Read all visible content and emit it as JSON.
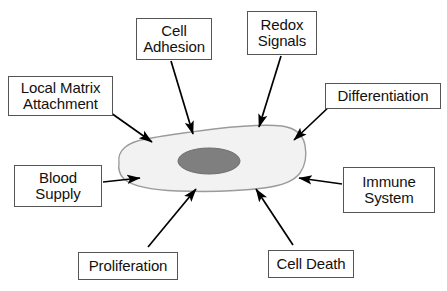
{
  "diagram": {
    "background_color": "#ffffff",
    "cell": {
      "name": "cell-body",
      "fill_color": "#f2f2f2",
      "stroke_color": "#999999",
      "nucleus": {
        "name": "nucleus",
        "fill_color": "#808080",
        "stroke_color": "#6e6e6e"
      }
    },
    "arrow_color": "#000000",
    "box_border_color": "#555555",
    "box_fill_color": "#ffffff",
    "text_color": "#111111",
    "labels": [
      {
        "id": "local-matrix-attachment",
        "lines": [
          "Local Matrix",
          "Attachment"
        ],
        "line1": "Local Matrix",
        "line2": "Attachment",
        "position": "upper-left",
        "x": 8,
        "y": 76,
        "w": 105,
        "h": 40
      },
      {
        "id": "cell-adhesion",
        "lines": [
          "Cell",
          "Adhesion"
        ],
        "line1": "Cell",
        "line2": "Adhesion",
        "position": "top-left-center",
        "x": 136,
        "y": 18,
        "w": 76,
        "h": 42
      },
      {
        "id": "redox-signals",
        "lines": [
          "Redox",
          "Signals"
        ],
        "line1": "Redox",
        "line2": "Signals",
        "position": "top-right-center",
        "x": 247,
        "y": 11,
        "w": 70,
        "h": 44
      },
      {
        "id": "differentiation",
        "lines": [
          "Differentiation"
        ],
        "line1": "Differentiation",
        "line2": "",
        "position": "upper-right",
        "x": 325,
        "y": 83,
        "w": 116,
        "h": 26
      },
      {
        "id": "blood-supply",
        "lines": [
          "Blood",
          "Supply"
        ],
        "line1": "Blood",
        "line2": "Supply",
        "position": "left",
        "x": 14,
        "y": 165,
        "w": 88,
        "h": 42
      },
      {
        "id": "immune-system",
        "lines": [
          "Immune",
          "System"
        ],
        "line1": "Immune",
        "line2": "System",
        "position": "right",
        "x": 343,
        "y": 167,
        "w": 92,
        "h": 46
      },
      {
        "id": "proliferation",
        "lines": [
          "Proliferation"
        ],
        "line1": "Proliferation",
        "line2": "",
        "position": "bottom-left",
        "x": 78,
        "y": 252,
        "w": 100,
        "h": 28
      },
      {
        "id": "cell-death",
        "lines": [
          "Cell Death"
        ],
        "line1": "Cell Death",
        "line2": "",
        "position": "bottom-right",
        "x": 268,
        "y": 250,
        "w": 86,
        "h": 28
      }
    ],
    "arrows": [
      {
        "id": "arrow-local-matrix-attachment",
        "from": "local-matrix-attachment",
        "to": "cell-body",
        "x1": 104,
        "y1": 108,
        "x2": 152,
        "y2": 142
      },
      {
        "id": "arrow-cell-adhesion",
        "from": "cell-adhesion",
        "to": "cell-body",
        "x1": 171,
        "y1": 61,
        "x2": 193,
        "y2": 134
      },
      {
        "id": "arrow-redox-signals",
        "from": "redox-signals",
        "to": "cell-body",
        "x1": 281,
        "y1": 56,
        "x2": 259,
        "y2": 127
      },
      {
        "id": "arrow-differentiation",
        "from": "differentiation",
        "to": "cell-body",
        "x1": 332,
        "y1": 104,
        "x2": 294,
        "y2": 140
      },
      {
        "id": "arrow-blood-supply",
        "from": "blood-supply",
        "to": "cell-body",
        "x1": 103,
        "y1": 182,
        "x2": 140,
        "y2": 178
      },
      {
        "id": "arrow-immune-system",
        "from": "immune-system",
        "to": "cell-body",
        "x1": 342,
        "y1": 184,
        "x2": 299,
        "y2": 178
      },
      {
        "id": "arrow-proliferation",
        "from": "proliferation",
        "to": "cell-body",
        "x1": 148,
        "y1": 247,
        "x2": 196,
        "y2": 189
      },
      {
        "id": "arrow-cell-death",
        "from": "cell-death",
        "to": "cell-body",
        "x1": 293,
        "y1": 245,
        "x2": 256,
        "y2": 189
      }
    ]
  }
}
